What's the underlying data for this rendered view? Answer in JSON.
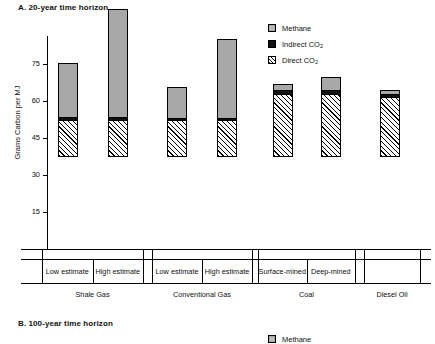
{
  "panels": {
    "a": {
      "title": "A.  20-year time horizon"
    },
    "b": {
      "title": "B.  100-year time horizon"
    }
  },
  "legend": {
    "methane": "Methane",
    "indirect_co2_text": "Indirect CO",
    "indirect_co2_sub": "2",
    "direct_co2_text": "Direct CO",
    "direct_co2_sub": "2"
  },
  "legend_b": {
    "methane": "Methane"
  },
  "axis": {
    "ylabel": "Grams Carbon per MJ",
    "yticks": [
      "15",
      "30",
      "45",
      "60",
      "75"
    ]
  },
  "groups": [
    {
      "name": "Shale Gas",
      "subcats": [
        "Low estimate",
        "High estimate"
      ]
    },
    {
      "name": "Conventional Gas",
      "subcats": [
        "Low estimate",
        "High estimate"
      ]
    },
    {
      "name": "Coal",
      "subcats": [
        "Surface-mined",
        "Deep-mined"
      ]
    },
    {
      "name": "Diesel Oil",
      "subcats": [
        ""
      ]
    }
  ],
  "chart_data": {
    "type": "bar",
    "title": "A.  20-year time horizon",
    "subtitle": "",
    "xlabel": "",
    "ylabel": "Grams Carbon per MJ",
    "ylim": [
      0,
      80
    ],
    "yticks": [
      15,
      30,
      45,
      60,
      75
    ],
    "grid": false,
    "stacked": true,
    "legend_position": "top-right",
    "categories": [
      "Shale Gas - Low estimate",
      "Shale Gas - High estimate",
      "Conventional Gas - Low estimate",
      "Conventional Gas - High estimate",
      "Coal - Surface-mined",
      "Coal - Deep-mined",
      "Diesel Oil"
    ],
    "series": [
      {
        "name": "Direct CO2",
        "color": "#ffffff",
        "pattern": "hatched",
        "values": [
          15.0,
          15.0,
          15.0,
          15.0,
          25.5,
          25.5,
          24.5
        ]
      },
      {
        "name": "Indirect CO2",
        "color": "#111111",
        "pattern": "solid",
        "values": [
          1.2,
          1.2,
          1.0,
          1.0,
          1.5,
          1.5,
          1.0
        ]
      },
      {
        "name": "Methane",
        "color": "#a8a8a8",
        "pattern": "solid",
        "values": [
          21.8,
          43.8,
          12.5,
          32.0,
          2.5,
          5.5,
          1.5
        ]
      }
    ],
    "totals": [
      38.0,
      60.0,
      28.5,
      48.0,
      29.5,
      32.5,
      27.0
    ]
  }
}
